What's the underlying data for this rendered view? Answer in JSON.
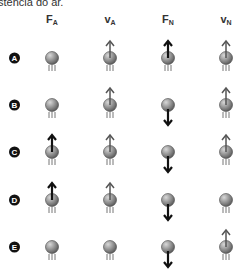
{
  "intro_text": "stência do ar.",
  "columns": [
    {
      "label": "F",
      "sub": "A",
      "x": 52
    },
    {
      "label": "v",
      "sub": "A",
      "x": 110
    },
    {
      "label": "F",
      "sub": "N",
      "x": 168
    },
    {
      "label": "v",
      "sub": "N",
      "x": 226
    }
  ],
  "rows": [
    {
      "label": "A",
      "y": 58,
      "cells": [
        "none",
        "up",
        "up-bold",
        "up"
      ]
    },
    {
      "label": "B",
      "y": 105,
      "cells": [
        "none",
        "up",
        "down-bold",
        "up"
      ]
    },
    {
      "label": "C",
      "y": 152,
      "cells": [
        "up-bold",
        "up",
        "down-bold",
        "up"
      ]
    },
    {
      "label": "D",
      "y": 200,
      "cells": [
        "up-bold",
        "up",
        "down-bold",
        "none"
      ]
    },
    {
      "label": "E",
      "y": 247,
      "cells": [
        "none",
        "none",
        "down-bold",
        "up"
      ]
    }
  ],
  "colors": {
    "ball_light": "#d8d8d8",
    "ball_dark": "#555555",
    "arrow_bold": "#111111",
    "arrow_light": "#555555",
    "streak": "#777777"
  }
}
